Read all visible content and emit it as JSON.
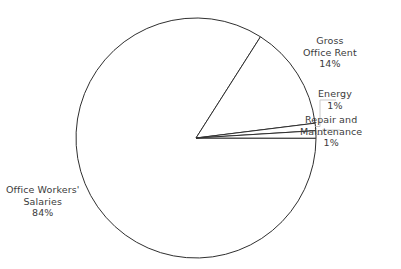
{
  "chart_data": {
    "type": "pie",
    "title": "",
    "subtitle": "",
    "xlabel": "",
    "ylabel": "",
    "grid": false,
    "legend_position": "none",
    "labels_position": "outside-callout",
    "categories": [
      "Gross Office Rent",
      "Energy",
      "Repair and Maintenance",
      "Office Workers' Salaries"
    ],
    "values": [
      14,
      1,
      1,
      84
    ],
    "unit": "%",
    "slices": [
      {
        "name": "Gross Office Rent",
        "value": 14,
        "value_label": "14%",
        "label_lines": [
          "Gross",
          "Office Rent",
          "14%"
        ],
        "start_angle_deg": 57.5,
        "end_angle_deg": 7.1,
        "fill": "#ffffff",
        "stroke": "#2f2f2f"
      },
      {
        "name": "Energy",
        "value": 1,
        "value_label": "1%",
        "label_lines": [
          "Energy",
          "1%"
        ],
        "start_angle_deg": 7.1,
        "end_angle_deg": 3.5,
        "fill": "#ffffff",
        "stroke": "#2f2f2f"
      },
      {
        "name": "Repair and Maintenance",
        "value": 1,
        "value_label": "1%",
        "label_lines": [
          "Repair and",
          "Maintenance",
          "1%"
        ],
        "start_angle_deg": 3.5,
        "end_angle_deg": 0.0,
        "fill": "#ffffff",
        "stroke": "#2f2f2f"
      },
      {
        "name": "Office Workers' Salaries",
        "value": 84,
        "value_label": "84%",
        "label_lines": [
          "Office Workers'",
          "Salaries",
          "84%"
        ],
        "start_angle_deg": 0.0,
        "end_angle_deg": -302.5,
        "fill": "#ffffff",
        "stroke": "#2f2f2f"
      }
    ]
  },
  "labels": {
    "gross_office_rent": {
      "line1": "Gross",
      "line2": "Office Rent",
      "line3": "14%"
    },
    "energy": {
      "line1": "Energy",
      "line2": "1%"
    },
    "repair_maintenance": {
      "line1": "Repair and",
      "line2": "Maintenance",
      "line3": "1%"
    },
    "office_workers_salaries": {
      "line1": "Office Workers'",
      "line2": "Salaries",
      "line3": "84%"
    }
  },
  "colors": {
    "background": "#ffffff",
    "slice_fill": "#ffffff",
    "slice_stroke": "#2f2f2f",
    "leader_line": "#c9c9c9",
    "text": "#3b3b3b"
  }
}
